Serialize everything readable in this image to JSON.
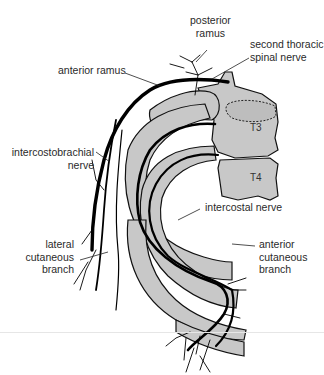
{
  "figure": {
    "colors": {
      "bone_fill": "#c8c8c8",
      "outline": "#111111",
      "nerve": "#000000",
      "background": "#ffffff"
    },
    "labels": {
      "posterior_ramus_line1": "posterior",
      "posterior_ramus_line2": "ramus",
      "second_thoracic_line1": "second thoracic",
      "second_thoracic_line2": "spinal nerve",
      "anterior_ramus": "anterior ramus",
      "intercostobrachial_line1": "intercostobrachial",
      "intercostobrachial_line2": "nerve",
      "intercostal_nerve": "intercostal nerve",
      "lateral_cutaneous_line1": "lateral",
      "lateral_cutaneous_line2": "cutaneous",
      "lateral_cutaneous_line3": "branch",
      "anterior_cutaneous_line1": "anterior",
      "anterior_cutaneous_line2": "cutaneous",
      "anterior_cutaneous_line3": "branch"
    },
    "vertebrae": {
      "t3": "T3",
      "t4": "T4"
    }
  }
}
